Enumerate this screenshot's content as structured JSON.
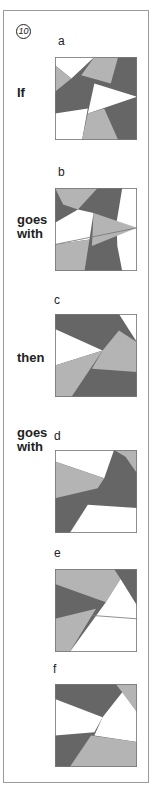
{
  "question": {
    "number": "10",
    "words": {
      "if": "If",
      "goes_with_1": "goes\nwith",
      "then": "then",
      "goes_with_2": "goes\nwith"
    },
    "options": [
      {
        "label": "a",
        "role": "premise"
      },
      {
        "label": "b",
        "role": "premise-pair"
      },
      {
        "label": "c",
        "role": "query"
      },
      {
        "label": "d",
        "role": "answer-choice"
      },
      {
        "label": "e",
        "role": "answer-choice"
      },
      {
        "label": "f",
        "role": "answer-choice"
      }
    ]
  },
  "colors": {
    "dark_gray": "#666666",
    "light_gray": "#b4b4b4",
    "white": "#ffffff",
    "frame": "#9a9a9a"
  }
}
